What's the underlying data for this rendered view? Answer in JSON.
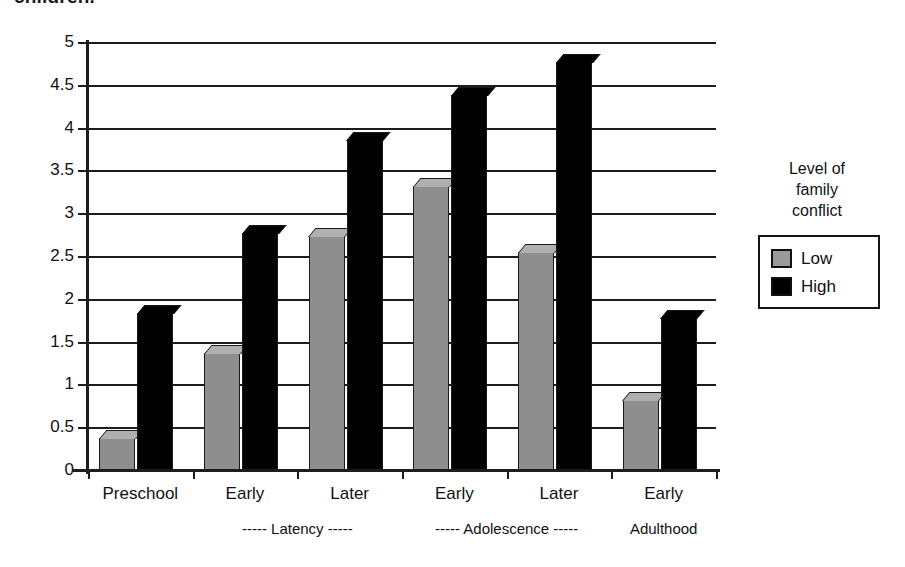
{
  "top_caption": "children.",
  "legend": {
    "title_line1": "Level of",
    "title_line2": "family",
    "title_line3": "conflict",
    "items": [
      {
        "label": "Low",
        "color": "#9a9a9a",
        "swatch": "low-swatch"
      },
      {
        "label": "High",
        "color": "#000000",
        "swatch": "high-swatch"
      }
    ]
  },
  "axis": {
    "y_ticks": [
      "5",
      "4.5",
      "4",
      "3.5",
      "3",
      "2.5",
      "2",
      "1.5",
      "1",
      "0.5",
      "0"
    ],
    "x_categories": [
      "Preschool",
      "Early",
      "Later",
      "Early",
      "Later",
      "Early"
    ],
    "x_groups": [
      "----- Latency -----",
      "----- Adolescence -----",
      "Adulthood"
    ]
  },
  "chart_data": {
    "type": "bar",
    "title": "",
    "subtitle": "",
    "xlabel": "",
    "ylabel": "",
    "ylim": [
      0,
      5
    ],
    "ytick_step": 0.5,
    "grid": true,
    "legend_position": "right",
    "legend_title": "Level of family conflict",
    "categories": [
      "Preschool",
      "Early",
      "Later",
      "Early",
      "Later",
      "Early"
    ],
    "group_labels": [
      "",
      "----- Latency -----",
      "----- Latency -----",
      "----- Adolescence -----",
      "----- Adolescence -----",
      "Adulthood"
    ],
    "series": [
      {
        "name": "Low",
        "color": "#9a9a9a",
        "values": [
          0.37,
          1.37,
          2.73,
          3.32,
          2.55,
          0.82
        ]
      },
      {
        "name": "High",
        "color": "#000000",
        "values": [
          1.84,
          2.77,
          3.85,
          4.38,
          4.77,
          1.78
        ]
      }
    ]
  }
}
